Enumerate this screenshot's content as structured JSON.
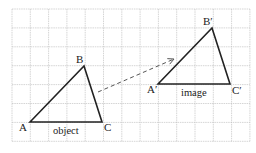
{
  "diagram": {
    "title": "",
    "grid": {
      "x0": 12,
      "y0": 9,
      "cols": 13,
      "rows": 7,
      "cell_w": 18.3,
      "cell_h": 18.9,
      "color": "#b8b8b8"
    },
    "object": {
      "label": "object",
      "vertices": [
        {
          "name": "A",
          "x": 30,
          "y": 122
        },
        {
          "name": "B",
          "x": 84,
          "y": 66
        },
        {
          "name": "C",
          "x": 102,
          "y": 122
        }
      ]
    },
    "image": {
      "label": "image",
      "vertices": [
        {
          "name": "A′",
          "x": 158,
          "y": 84
        },
        {
          "name": "B′",
          "x": 212,
          "y": 28
        },
        {
          "name": "C′",
          "x": 230,
          "y": 84
        }
      ]
    },
    "translation_arrow": {
      "from": [
        98,
        92
      ],
      "to": [
        174,
        59
      ],
      "style": "dashed"
    },
    "colors": {
      "line": "#222222",
      "grid": "#b8b8b8",
      "arrow": "#555555"
    }
  }
}
